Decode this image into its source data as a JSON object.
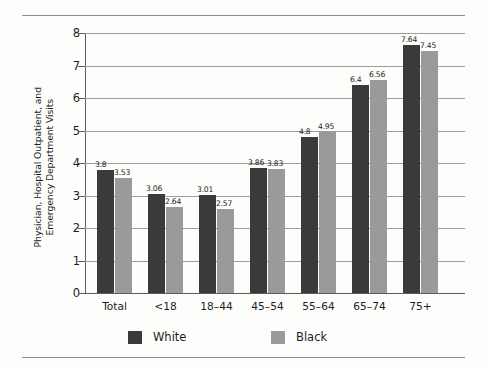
{
  "chart_data": {
    "type": "bar",
    "title": "",
    "subtitle": "",
    "xlabel": "",
    "ylabel": "Physician, Hospital Outpatient, and\nEmergency Department Visits",
    "categories": [
      "Total",
      "<18",
      "18–44",
      "45–54",
      "55–64",
      "65–74",
      "75+"
    ],
    "series": [
      {
        "name": "White",
        "color": "#3a3a3a",
        "values": [
          3.8,
          3.06,
          3.01,
          3.86,
          4.8,
          6.4,
          7.64
        ],
        "value_labels": [
          "3.8",
          "3.06",
          "3.01",
          "3.86",
          "4.8",
          "6.4",
          "7.64"
        ]
      },
      {
        "name": "Black",
        "color": "#9a9a9a",
        "values": [
          3.53,
          2.64,
          2.57,
          3.83,
          4.95,
          6.56,
          7.45
        ],
        "value_labels": [
          "3.53",
          "2.64",
          "2.57",
          "3.83",
          "4.95",
          "6.56",
          "7.45"
        ]
      }
    ],
    "ylim": [
      0,
      8
    ],
    "ytick_labels": [
      "0",
      "1",
      "2",
      "3",
      "4",
      "5",
      "6",
      "7",
      "8"
    ],
    "ytick_values": [
      0,
      1,
      2,
      3,
      4,
      5,
      6,
      7,
      8
    ],
    "grid": true,
    "grid_axis": "y",
    "legend_position": "bottom",
    "legend": [
      "White",
      "Black"
    ],
    "annotations": []
  },
  "figure": {
    "background_color": "#fdfdfc",
    "axis_color": "#5c5c5c",
    "grid_color": "#9d9d9d",
    "rule_color": "#8e8e8e",
    "text_color": "#1d1d1d"
  }
}
